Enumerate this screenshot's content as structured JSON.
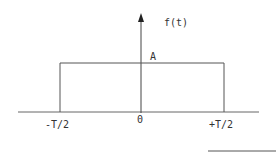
{
  "diagram": {
    "y_axis_label": "f(t)",
    "amplitude_label": "A",
    "origin_label": "0",
    "left_edge_label": "-T/2",
    "right_edge_label": "+T/2"
  },
  "colors": {
    "line": "#555555",
    "text": "#333333",
    "background": "#ffffff"
  }
}
